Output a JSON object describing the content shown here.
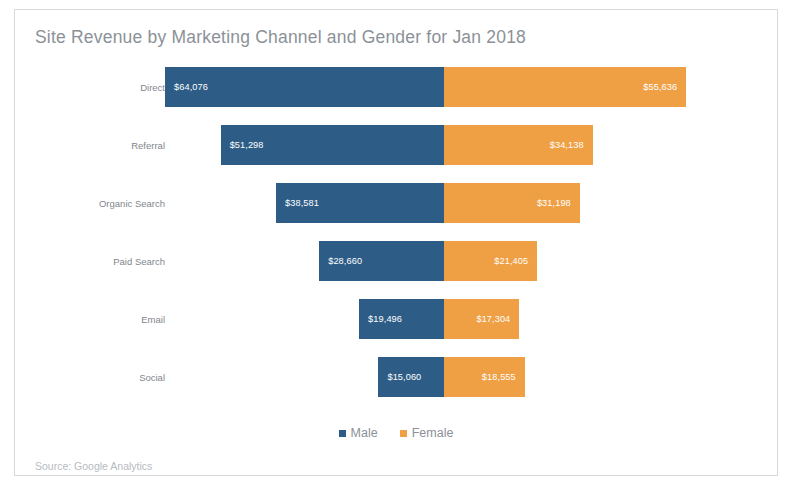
{
  "card": {
    "title": "Site Revenue by Marketing Channel and Gender for Jan 2018",
    "source": "Source: Google Analytics"
  },
  "legend": {
    "items": [
      {
        "label": "Male",
        "color": "#2d5d86"
      },
      {
        "label": "Female",
        "color": "#f0a044"
      }
    ]
  },
  "chart_data": {
    "type": "bar",
    "subtype": "diverging-stacked-bar",
    "orientation": "horizontal",
    "title": "Site Revenue by Marketing Channel and Gender for Jan 2018",
    "xlabel": "",
    "ylabel": "",
    "grid": false,
    "legend_position": "bottom-center",
    "source": "Source: Google Analytics",
    "value_prefix": "$",
    "categories": [
      "Direct",
      "Referral",
      "Organic Search",
      "Paid Search",
      "Email",
      "Social"
    ],
    "series": [
      {
        "name": "Male",
        "color": "#2d5d86",
        "direction": "left",
        "values": [
          64076,
          51298,
          38581,
          28660,
          19496,
          15060
        ],
        "labels": [
          "$64,076",
          "$51,298",
          "$38,581",
          "$28,660",
          "$19,496",
          "$15,060"
        ]
      },
      {
        "name": "Female",
        "color": "#f0a044",
        "direction": "right",
        "values": [
          55636,
          34138,
          31198,
          21405,
          17304,
          18555
        ],
        "labels": [
          "$55,636",
          "$34,138",
          "$31,198",
          "$21,405",
          "$17,304",
          "$18,555"
        ]
      }
    ],
    "totals": [
      119712,
      85436,
      69779,
      50065,
      36800,
      33615
    ],
    "max_side_value": 64076
  }
}
